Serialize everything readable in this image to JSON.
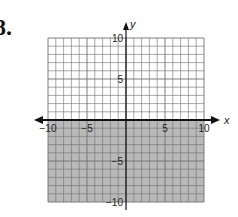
{
  "problem_number": "8.",
  "chart_data": {
    "type": "area",
    "title": "",
    "xlabel": "x",
    "ylabel": "y",
    "xlim": [
      -10,
      10
    ],
    "ylim": [
      -10,
      10
    ],
    "grid": true,
    "x_ticks": [
      "−10",
      "−5",
      "5",
      "10"
    ],
    "y_ticks": [
      "10",
      "5",
      "−5",
      "−10"
    ],
    "boundary": {
      "equation": "y = 0",
      "style": "solid"
    },
    "shaded_region": "y <= 0",
    "colors": {
      "shade": "#b9b9b9",
      "grid": "#6f6f6f",
      "axis": "#111111"
    }
  }
}
